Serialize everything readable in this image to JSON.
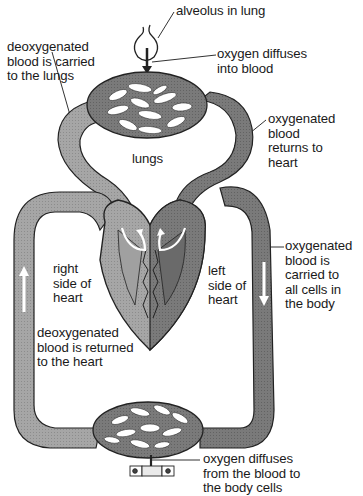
{
  "diagram": {
    "colors": {
      "vessel_deoxygenated": "#a8a8a8",
      "vessel_oxygenated": "#7e7e7e",
      "outline": "#2a2a2a",
      "heart_right": "#9a9a9a",
      "heart_left": "#6e6e6e",
      "arrow": "#ffffff",
      "background": "#ffffff"
    },
    "labels": {
      "alveolus": "alveolus in lung",
      "deoxy_to_lungs": "deoxygenated\nblood is carried\nto the lungs",
      "oxygen_into_blood": "oxygen diffuses\ninto blood",
      "oxy_returns": "oxygenated\nblood\nreturns to\nheart",
      "lungs": "lungs",
      "right_side": "right\nside of\nheart",
      "left_side": "left\nside of\nheart",
      "oxy_to_cells": "oxygenated\nblood is\ncarried to\nall cells in\nthe body",
      "deoxy_returned": "deoxygenated\nblood is returned\nto the heart",
      "oxygen_to_cells": "oxygen diffuses\nfrom the blood to\nthe body cells"
    },
    "icons": {
      "alveolus": "alveolus-icon",
      "lung_capillaries": "lung-capillary-network-icon",
      "heart": "heart-icon",
      "body_capillaries": "body-capillary-network-icon",
      "body_cells": "body-cells-icon"
    }
  }
}
